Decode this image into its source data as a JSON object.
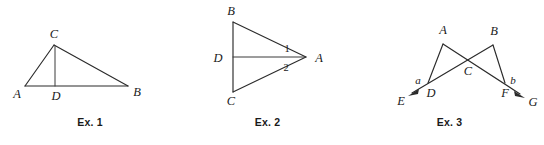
{
  "page": {
    "background_color": "#ffffff",
    "ink_color": "#2b2b2b",
    "figure_count": 3
  },
  "figures": [
    {
      "id": "ex-1",
      "caption": "Ex. 1",
      "description": "Triangle ABC with cevian CD drawn from apex C to base AB",
      "vertex_labels": [
        "C",
        "A",
        "D",
        "B"
      ],
      "labels": {
        "C": "C",
        "A": "A",
        "D": "D",
        "B": "B"
      },
      "points": {
        "A": [
          25,
          86
        ],
        "B": [
          128,
          86
        ],
        "C": [
          54,
          45
        ],
        "D": [
          55,
          86
        ]
      },
      "segments": [
        "AB",
        "AC",
        "CB",
        "CD"
      ]
    },
    {
      "id": "ex-2",
      "caption": "Ex. 2",
      "description": "Triangle ABC pointing right, with segment DA from midpoint D of side BC to vertex A; angles 1 and 2 at A",
      "vertex_labels": [
        "B",
        "D",
        "C",
        "A"
      ],
      "labels": {
        "B": "B",
        "D": "D",
        "C": "C",
        "A": "A",
        "angle_1": "1",
        "angle_2": "2"
      },
      "points": {
        "B": [
          53,
          22
        ],
        "C": [
          53,
          92
        ],
        "D": [
          53,
          57
        ],
        "A": [
          126,
          57
        ]
      },
      "segments": [
        "BC",
        "BA",
        "CA",
        "DA"
      ],
      "angle_marks": [
        "1",
        "2"
      ]
    },
    {
      "id": "ex-3",
      "caption": "Ex. 3",
      "description": "Two triangles ADC-ish crossing: ray EF through D and C to G, ray GD through F and C; apexes A and B, intersection C, exterior angles a and b",
      "vertex_labels": [
        "A",
        "B",
        "C",
        "D",
        "F",
        "E",
        "G"
      ],
      "labels": {
        "A": "A",
        "B": "B",
        "C": "C",
        "D": "D",
        "F": "F",
        "E": "E",
        "G": "G",
        "angle_a": "a",
        "angle_b": "b"
      },
      "points": {
        "A": [
          88,
          42
        ],
        "B": [
          138,
          43
        ],
        "C": [
          113,
          62
        ],
        "D": [
          73,
          83
        ],
        "F": [
          150,
          83
        ],
        "E": [
          53,
          96
        ],
        "G": [
          169,
          97
        ]
      },
      "segments": [
        "AD",
        "AF",
        "BD",
        "BF",
        "DE",
        "FG"
      ],
      "angle_marks": [
        "a",
        "b"
      ],
      "arrows": [
        "E",
        "G"
      ]
    }
  ]
}
